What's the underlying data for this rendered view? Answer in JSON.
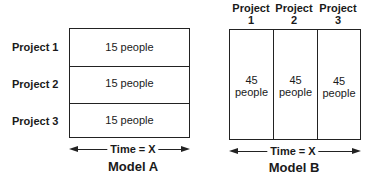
{
  "model_a": {
    "title": "Model A",
    "rows": [
      {
        "label": "Project 1",
        "value": "15 people"
      },
      {
        "label": "Project 2",
        "value": "15 people"
      },
      {
        "label": "Project 3",
        "value": "15 people"
      }
    ],
    "time_label": "Time = X"
  },
  "model_b": {
    "title": "Model B",
    "columns": [
      {
        "label_line1": "Project",
        "label_line2": "1",
        "value_line1": "45",
        "value_line2": "people"
      },
      {
        "label_line1": "Project",
        "label_line2": "2",
        "value_line1": "45",
        "value_line2": "people"
      },
      {
        "label_line1": "Project",
        "label_line2": "3",
        "value_line1": "45",
        "value_line2": "people"
      }
    ],
    "time_label": "Time = X"
  }
}
